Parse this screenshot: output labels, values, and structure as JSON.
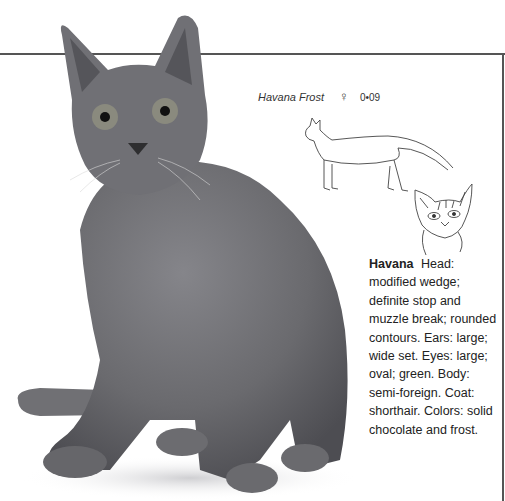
{
  "page": {
    "photo": {
      "subject": "gray shorthair cat sitting, facing viewer",
      "alt": "Havana Frost cat photograph"
    },
    "caption": {
      "name": "Havana Frost",
      "symbol": "♀",
      "code": "0•09"
    },
    "drawings": {
      "body": "line drawing of cat in profile, standing",
      "head": "line drawing of cat head, front view"
    },
    "description": {
      "breed": "Havana",
      "text": "Head: modified wedge; definite stop and muzzle break; rounded contours. Ears: large; wide set. Eyes: large; oval; green. Body: semi-foreign. Coat: shorthair. Colors: solid chocolate and frost."
    },
    "colors": {
      "rule": "#555555",
      "cat_gray": "#6e6e70",
      "text": "#222222"
    }
  }
}
